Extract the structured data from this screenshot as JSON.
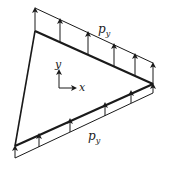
{
  "figure": {
    "colors": {
      "ink": "#1a1a1a",
      "background": "#ffffff"
    },
    "labels": {
      "top_load_main": "p",
      "top_load_sub": "y",
      "bottom_load_main": "p",
      "bottom_load_sub": "y",
      "axis_y": "y",
      "axis_x": "x"
    },
    "triangle": {
      "vertices": [
        [
          35,
          31
        ],
        [
          153,
          84
        ],
        [
          15,
          146
        ]
      ]
    },
    "top_load": {
      "line": [
        [
          35,
          8
        ],
        [
          153,
          63
        ]
      ],
      "arrow_count": 6
    },
    "bottom_load": {
      "line": [
        [
          15,
          158
        ],
        [
          153,
          93
        ]
      ],
      "arrow_count": 6
    },
    "axes": {
      "origin": [
        59,
        88
      ]
    }
  }
}
